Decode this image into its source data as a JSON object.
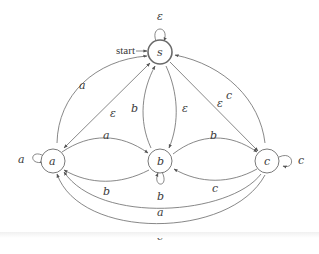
{
  "diagram": {
    "type": "finite-automaton",
    "start_label": "start",
    "states": [
      {
        "id": "s",
        "label": "s",
        "accepting": true,
        "start": true
      },
      {
        "id": "a",
        "label": "a",
        "accepting": false
      },
      {
        "id": "b",
        "label": "b",
        "accepting": false
      },
      {
        "id": "c",
        "label": "c",
        "accepting": false
      }
    ],
    "transitions": [
      {
        "from": "s",
        "to": "s",
        "label": "ε"
      },
      {
        "from": "a",
        "to": "s",
        "label": "a"
      },
      {
        "from": "s",
        "to": "a",
        "label": "ε"
      },
      {
        "from": "b",
        "to": "s",
        "label": "b"
      },
      {
        "from": "s",
        "to": "b",
        "label": "ε"
      },
      {
        "from": "s",
        "to": "c",
        "label": "ε"
      },
      {
        "from": "c",
        "to": "s",
        "label": "c"
      },
      {
        "from": "a",
        "to": "a",
        "label": "a"
      },
      {
        "from": "a",
        "to": "b",
        "label": "a"
      },
      {
        "from": "b",
        "to": "a",
        "label": "b"
      },
      {
        "from": "b",
        "to": "b",
        "label": "b"
      },
      {
        "from": "b",
        "to": "c",
        "label": "b"
      },
      {
        "from": "c",
        "to": "b",
        "label": "c"
      },
      {
        "from": "c",
        "to": "c",
        "label": "c"
      },
      {
        "from": "c",
        "to": "a",
        "label": "a"
      },
      {
        "from": "c",
        "to": "a",
        "label": "c"
      }
    ]
  },
  "labels": {
    "s": "s",
    "a": "a",
    "b": "b",
    "c": "c",
    "start": "start",
    "loop_s": "ε",
    "a_to_s": "a",
    "s_to_a": "ε",
    "b_to_s": "b",
    "s_to_b": "ε",
    "s_to_c": "ε",
    "c_to_s": "c",
    "loop_a": "a",
    "a_to_b": "a",
    "b_to_a": "b",
    "loop_b": "b",
    "b_to_c": "b",
    "c_to_b": "c",
    "loop_c": "c",
    "c_to_a_inner": "a",
    "c_to_a_outer": "c"
  },
  "colors": {
    "stroke": "#6a6a6a",
    "text": "#3a3a3a",
    "background": "#ffffff"
  }
}
